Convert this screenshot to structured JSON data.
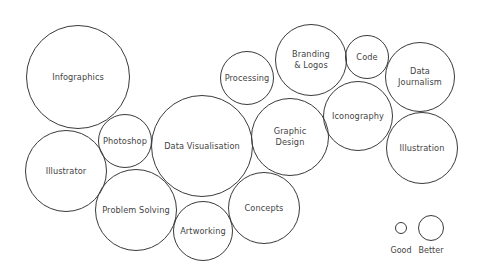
{
  "diagram": {
    "type": "bubble-cluster",
    "stroke_color": "#3a3a3a",
    "text_color": "#444444",
    "background": "#ffffff",
    "bubbles": [
      {
        "label": "Infographics",
        "cx": 78,
        "cy": 77,
        "r": 52
      },
      {
        "label": "Processing",
        "cx": 247,
        "cy": 78,
        "r": 27
      },
      {
        "label": "Branding\n& Logos",
        "cx": 311,
        "cy": 60,
        "r": 36
      },
      {
        "label": "Code",
        "cx": 367,
        "cy": 57,
        "r": 22
      },
      {
        "label": "Data\nJournalism",
        "cx": 420,
        "cy": 77,
        "r": 35
      },
      {
        "label": "Photoshop",
        "cx": 125,
        "cy": 141,
        "r": 27
      },
      {
        "label": "Data Visualisation",
        "cx": 202,
        "cy": 146,
        "r": 51
      },
      {
        "label": "Graphic\nDesign",
        "cx": 290,
        "cy": 137,
        "r": 39
      },
      {
        "label": "Iconography",
        "cx": 358,
        "cy": 116,
        "r": 35
      },
      {
        "label": "Illustration",
        "cx": 422,
        "cy": 148,
        "r": 36
      },
      {
        "label": "Illustrator",
        "cx": 66,
        "cy": 171,
        "r": 41
      },
      {
        "label": "Problem Solving",
        "cx": 136,
        "cy": 210,
        "r": 41
      },
      {
        "label": "Artworking",
        "cx": 203,
        "cy": 231,
        "r": 30
      },
      {
        "label": "Concepts",
        "cx": 264,
        "cy": 208,
        "r": 36
      }
    ],
    "legend": [
      {
        "label": "Good",
        "cx": 401,
        "cy": 228,
        "r": 6,
        "label_y": 246
      },
      {
        "label": "Better",
        "cx": 431,
        "cy": 228,
        "r": 13,
        "label_y": 246
      }
    ]
  }
}
